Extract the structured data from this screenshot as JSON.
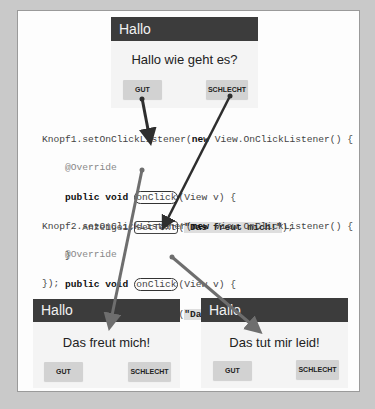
{
  "top_app": {
    "title": "Hallo",
    "message": "Hallo wie geht es?",
    "buttons": [
      "GUT",
      "SCHLECHT"
    ]
  },
  "code": {
    "block1": {
      "line1_pre": "Knopf1.setOnClickListener(",
      "line1_kw": "new",
      "line1_post": " View.OnClickListener() {",
      "override": "@Override",
      "sig_kw": "public void ",
      "sig_method": "onClick",
      "sig_rest": "(View v) {",
      "body_obj": "Anzeige1.",
      "body_method": "setText",
      "body_open": "(",
      "body_string": "\"Das freut mich!\"",
      "body_close": ");",
      "close_brace": "}",
      "close_all": "});"
    },
    "block2": {
      "line1_pre": "Knopf2.setOnClickListener(",
      "line1_kw": "new",
      "line1_post": " View.OnClickListener() {",
      "override": "@Override",
      "sig_kw": "public void ",
      "sig_method": "onClick",
      "sig_rest": "(View v) {",
      "body_obj": "Anzeige1.",
      "body_method": "setText",
      "body_open": "(",
      "body_string": "\"Das tut mir leid!\"",
      "body_close": ");",
      "close_brace": "}",
      "close_all": "});"
    }
  },
  "result_left": {
    "title": "Hallo",
    "message": "Das freut mich!",
    "buttons": [
      "GUT",
      "SCHLECHT"
    ]
  },
  "result_right": {
    "title": "Hallo",
    "message": "Das tut mir leid!",
    "buttons": [
      "GUT",
      "SCHLECHT"
    ]
  },
  "colors": {
    "background": "#c9c9c9",
    "app_header": "#3c3c3c",
    "arrow_dark": "#2e2e2e",
    "arrow_gray": "#6e6e6e"
  }
}
